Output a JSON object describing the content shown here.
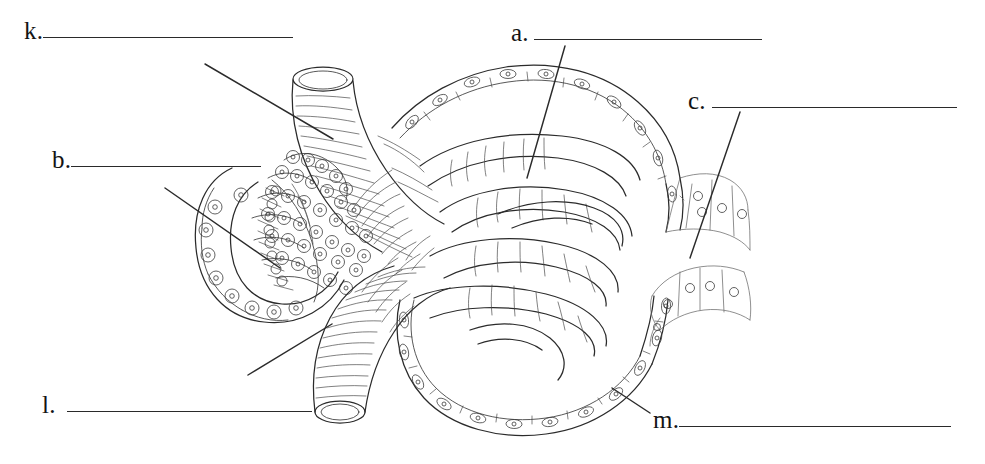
{
  "worksheet": {
    "title": "Renal corpuscle labeling diagram",
    "background_color": "#ffffff",
    "ink_color": "#2b2b2b",
    "blank_line_color": "#2a2a2a"
  },
  "labels": [
    {
      "id": "k",
      "letter": "k.",
      "answer_text": "",
      "blank_width": 250,
      "position": {
        "x": 24,
        "y": 18
      },
      "leader": {
        "from": [
          205,
          64
        ],
        "to": [
          333,
          139
        ]
      },
      "points_to": "afferent-arteriole"
    },
    {
      "id": "b",
      "letter": "b.",
      "answer_text": "",
      "blank_width": 190,
      "position": {
        "x": 52,
        "y": 147
      },
      "leader": {
        "from": [
          165,
          188
        ],
        "to": [
          280,
          268
        ]
      },
      "points_to": "juxtaglomerular-cells"
    },
    {
      "id": "l",
      "letter": "l.",
      "answer_text": "",
      "blank_width": 245,
      "position": {
        "x": 42,
        "y": 392
      },
      "leader": {
        "from": [
          248,
          375
        ],
        "to": [
          332,
          324
        ]
      },
      "points_to": "efferent-arteriole"
    },
    {
      "id": "a",
      "letter": "a.",
      "answer_text": "",
      "blank_width": 228,
      "position": {
        "x": 511,
        "y": 20
      },
      "leader": {
        "from": [
          565,
          46
        ],
        "to": [
          527,
          178
        ]
      },
      "points_to": "glomerular-capillaries"
    },
    {
      "id": "c",
      "letter": "c.",
      "answer_text": "",
      "blank_width": 245,
      "position": {
        "x": 688,
        "y": 88
      },
      "leader": {
        "from": [
          740,
          112
        ],
        "to": [
          690,
          258
        ]
      },
      "points_to": "proximal-convoluted-tubule"
    },
    {
      "id": "m",
      "letter": "m.",
      "answer_text": "",
      "blank_width": 272,
      "position": {
        "x": 653,
        "y": 407
      },
      "leader": {
        "from": [
          650,
          413
        ],
        "to": [
          612,
          388
        ]
      },
      "points_to": "parietal-layer-bowmans-capsule"
    }
  ],
  "figure": {
    "name": "renal-corpuscle-line-drawing",
    "structures": [
      "afferent-arteriole",
      "efferent-arteriole",
      "glomerular-capillary-tuft",
      "bowmans-capsule",
      "proximal-convoluted-tubule",
      "distal-tubule-macula-densa",
      "juxtaglomerular-apparatus"
    ]
  }
}
